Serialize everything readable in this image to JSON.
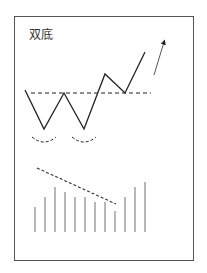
{
  "title": "双底",
  "colors": {
    "frame": "#555555",
    "line": "#222222",
    "volume": "#888888",
    "text": "#333333"
  },
  "chart_data": {
    "type": "line",
    "title": "双底",
    "price_path": [
      [
        25,
        90
      ],
      [
        44,
        129
      ],
      [
        64,
        93
      ],
      [
        84,
        129
      ],
      [
        105,
        74
      ],
      [
        125,
        93
      ],
      [
        145,
        52
      ]
    ],
    "neckline": {
      "y": 93,
      "x_start": 31,
      "x_end": 151,
      "style": "dashed"
    },
    "arrow": {
      "from": [
        154,
        75
      ],
      "to": [
        164,
        42
      ]
    },
    "bottom_arcs": [
      {
        "cx": 44,
        "y": 137
      },
      {
        "cx": 84,
        "y": 137
      }
    ],
    "volume": {
      "baseline_y": 232,
      "bars": [
        {
          "x": 35,
          "top": 207
        },
        {
          "x": 45,
          "top": 197
        },
        {
          "x": 55,
          "top": 187
        },
        {
          "x": 65,
          "top": 192
        },
        {
          "x": 75,
          "top": 197
        },
        {
          "x": 85,
          "top": 197
        },
        {
          "x": 95,
          "top": 202
        },
        {
          "x": 105,
          "top": 202
        },
        {
          "x": 115,
          "top": 211
        },
        {
          "x": 125,
          "top": 197
        },
        {
          "x": 135,
          "top": 187
        },
        {
          "x": 145,
          "top": 182
        }
      ],
      "trend_line": {
        "from": [
          37,
          168
        ],
        "to": [
          116,
          204
        ],
        "style": "dashed"
      }
    }
  }
}
